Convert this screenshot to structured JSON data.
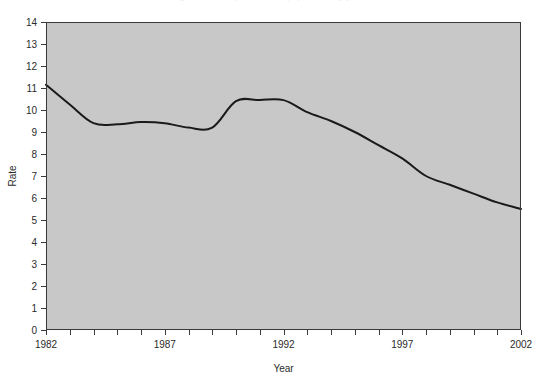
{
  "page": {
    "background_color": "#ffffff",
    "cropped_title_fragment": "Figure 1. Rate per 100,000 population by year"
  },
  "chart_data": {
    "type": "line",
    "title": "",
    "xlabel": "Year",
    "ylabel": "Rate",
    "xlim": [
      1982,
      2002
    ],
    "ylim": [
      0,
      14
    ],
    "grid": false,
    "legend": "none",
    "x_tick_labels": [
      "1982",
      "1987",
      "1992",
      "1997",
      "2002"
    ],
    "x_tick_label_years": [
      1982,
      1987,
      1992,
      1997,
      2002
    ],
    "x_minor_tick_step": 1,
    "y_tick_labels": [
      "0",
      "1",
      "2",
      "3",
      "4",
      "5",
      "6",
      "7",
      "8",
      "9",
      "10",
      "11",
      "12",
      "13",
      "14"
    ],
    "y_tick_values": [
      0,
      1,
      2,
      3,
      4,
      5,
      6,
      7,
      8,
      9,
      10,
      11,
      12,
      13,
      14
    ],
    "x": [
      1982,
      1983,
      1984,
      1985,
      1986,
      1987,
      1988,
      1989,
      1990,
      1991,
      1992,
      1993,
      1994,
      1995,
      1996,
      1997,
      1998,
      1999,
      2000,
      2001,
      2002
    ],
    "series": [
      {
        "name": "Rate",
        "color": "#1a1a1a",
        "line_width": 2,
        "values": [
          11.15,
          10.25,
          9.4,
          9.35,
          9.45,
          9.4,
          9.2,
          9.2,
          10.4,
          10.45,
          10.45,
          9.9,
          9.5,
          9.0,
          8.4,
          7.8,
          7.0,
          6.6,
          6.2,
          5.8,
          5.5
        ]
      }
    ],
    "style": {
      "plot_background_color": "#c8c8c8",
      "frame_color": "#3a3a3a",
      "page_background_color": "#ffffff",
      "tick_color": "#3a3a3a"
    }
  }
}
